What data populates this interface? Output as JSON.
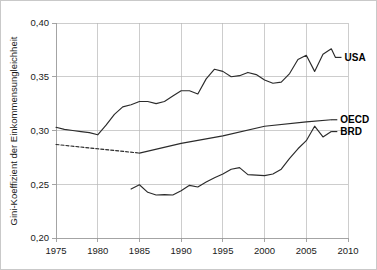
{
  "chart_data": {
    "type": "line",
    "title": "",
    "xlabel": "",
    "ylabel": "Gini-Koeffizient der Einkommensungleichheit",
    "xlim": [
      1975,
      2010
    ],
    "ylim": [
      0.2,
      0.4
    ],
    "grid": true,
    "legend_position": "right-inline-labels",
    "xticks": [
      "1975",
      "1980",
      "1985",
      "1990",
      "1995",
      "2000",
      "2005",
      "2010"
    ],
    "xtick_values": [
      1975,
      1980,
      1985,
      1990,
      1995,
      2000,
      2005,
      2010
    ],
    "yticks": [
      "0,20",
      "0,25",
      "0,30",
      "0,35",
      "0,40"
    ],
    "ytick_values": [
      0.2,
      0.25,
      0.3,
      0.35,
      0.4
    ],
    "decimal_separator": ",",
    "line_color": "#2b2b2b",
    "grid_color": "#b8b8b8",
    "series": [
      {
        "name": "USA",
        "label": "USA",
        "style": "solid",
        "x": [
          1975,
          1976,
          1977,
          1978,
          1979,
          1980,
          1981,
          1982,
          1983,
          1984,
          1985,
          1986,
          1987,
          1988,
          1989,
          1990,
          1991,
          1992,
          1993,
          1994,
          1995,
          1996,
          1997,
          1998,
          1999,
          2000,
          2001,
          2002,
          2003,
          2004,
          2005,
          2006,
          2007,
          2008
        ],
        "values": [
          0.303,
          0.301,
          0.3,
          0.299,
          0.298,
          0.296,
          0.305,
          0.315,
          0.322,
          0.324,
          0.327,
          0.327,
          0.325,
          0.327,
          0.332,
          0.337,
          0.337,
          0.334,
          0.348,
          0.357,
          0.355,
          0.35,
          0.351,
          0.354,
          0.352,
          0.347,
          0.344,
          0.345,
          0.353,
          0.366,
          0.37,
          0.355,
          0.371,
          0.376
        ],
        "final_value": 0.368
      },
      {
        "name": "OECD",
        "label": "OECD",
        "style": "dashed-then-solid",
        "dashed_range": [
          1975,
          1985
        ],
        "solid_range": [
          1985,
          2008
        ],
        "x": [
          1975,
          1980,
          1985,
          1990,
          1995,
          2000,
          2005,
          2008
        ],
        "values": [
          0.287,
          0.283,
          0.279,
          0.288,
          0.295,
          0.304,
          0.308,
          0.31
        ]
      },
      {
        "name": "BRD",
        "label": "BRD",
        "style": "solid",
        "x": [
          1984,
          1985,
          1986,
          1987,
          1988,
          1989,
          1990,
          1991,
          1992,
          1993,
          1994,
          1995,
          1996,
          1997,
          1998,
          1999,
          2000,
          2001,
          2002,
          2003,
          2004,
          2005,
          2006,
          2007,
          2008
        ],
        "values": [
          0.2455,
          0.2495,
          0.2425,
          0.24,
          0.2403,
          0.24,
          0.244,
          0.249,
          0.2475,
          0.252,
          0.256,
          0.2595,
          0.264,
          0.2655,
          0.259,
          0.2585,
          0.258,
          0.2595,
          0.264,
          0.274,
          0.283,
          0.2905,
          0.304,
          0.294,
          0.299
        ]
      }
    ]
  },
  "labels": {
    "usa": "USA",
    "oecd": "OECD",
    "brd": "BRD",
    "y_axis_title": "Gini-Koeffizient der Einkommensungleichheit"
  }
}
